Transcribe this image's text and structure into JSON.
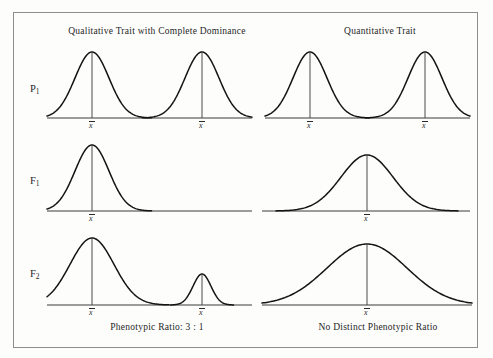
{
  "figure": {
    "type": "genetics-distribution-diagram",
    "background_color": "#fdfdfc",
    "border_color": "#8d8d8d",
    "curve_color": "#141414",
    "axis_color": "#3a3a3a"
  },
  "columns": [
    {
      "id": "qualitative",
      "title": "Qualitative Trait with Complete Dominance"
    },
    {
      "id": "quantitative",
      "title": "Quantitative Trait"
    }
  ],
  "row_labels": [
    {
      "id": "p1",
      "base": "P",
      "sub": "1"
    },
    {
      "id": "f1",
      "base": "F",
      "sub": "1"
    },
    {
      "id": "f2",
      "base": "F",
      "sub": "2"
    }
  ],
  "footer_notes": [
    {
      "id": "qualitative",
      "text": "Phenotypic Ratio:  3 : 1"
    },
    {
      "id": "quantitative",
      "text": "No Distinct Phenotypic Ratio"
    }
  ],
  "mean_symbol": "x",
  "chart_data": {
    "type": "line",
    "xlabel": "",
    "ylabel": "",
    "grid": false,
    "legend": "none",
    "panels": [
      {
        "panel_id": "p1-qualitative",
        "row": "P1",
        "column": "Qualitative Trait with Complete Dominance",
        "axis": {
          "x_start": 47,
          "x_end": 252,
          "baseline_y": 118
        },
        "curves": [
          {
            "mean_x": 92,
            "sigma": 17,
            "peak_y": 52,
            "mean_label": "x"
          },
          {
            "mean_x": 202,
            "sigma": 17,
            "peak_y": 52,
            "mean_label": "x"
          }
        ]
      },
      {
        "panel_id": "p1-quantitative",
        "row": "P1",
        "column": "Quantitative Trait",
        "axis": {
          "x_start": 265,
          "x_end": 470,
          "baseline_y": 118
        },
        "curves": [
          {
            "mean_x": 310,
            "sigma": 17,
            "peak_y": 52,
            "mean_label": "x"
          },
          {
            "mean_x": 425,
            "sigma": 17,
            "peak_y": 52,
            "mean_label": "x"
          }
        ]
      },
      {
        "panel_id": "f1-qualitative",
        "row": "F1",
        "column": "Qualitative Trait with Complete Dominance",
        "axis": {
          "x_start": 47,
          "x_end": 252,
          "baseline_y": 211
        },
        "curves": [
          {
            "mean_x": 92,
            "sigma": 17,
            "peak_y": 145,
            "mean_label": "x"
          }
        ]
      },
      {
        "panel_id": "f1-quantitative",
        "row": "F1",
        "column": "Quantitative Trait",
        "axis": {
          "x_start": 262,
          "x_end": 470,
          "baseline_y": 211
        },
        "curves": [
          {
            "mean_x": 367,
            "sigma": 26,
            "peak_y": 155,
            "mean_label": "x"
          }
        ]
      },
      {
        "panel_id": "f2-qualitative",
        "row": "F2",
        "column": "Qualitative Trait with Complete Dominance",
        "axis": {
          "x_start": 47,
          "x_end": 252,
          "baseline_y": 305
        },
        "curves": [
          {
            "mean_x": 92,
            "sigma": 22,
            "peak_y": 238,
            "mean_label": "x"
          },
          {
            "mean_x": 202,
            "sigma": 9,
            "peak_y": 274,
            "mean_label": "x"
          }
        ]
      },
      {
        "panel_id": "f2-quantitative",
        "row": "F2",
        "column": "Quantitative Trait",
        "axis": {
          "x_start": 262,
          "x_end": 472,
          "baseline_y": 305
        },
        "curves": [
          {
            "mean_x": 367,
            "sigma": 40,
            "peak_y": 244,
            "mean_label": "x"
          }
        ]
      }
    ]
  }
}
